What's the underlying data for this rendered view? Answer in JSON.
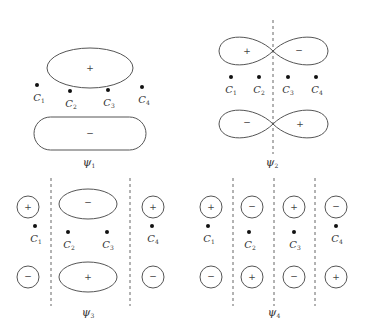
{
  "atoms": {
    "c1": {
      "base": "C",
      "sub": "1"
    },
    "c2": {
      "base": "C",
      "sub": "2"
    },
    "c3": {
      "base": "C",
      "sub": "3"
    },
    "c4": {
      "base": "C",
      "sub": "4"
    }
  },
  "signs": {
    "plus": "+",
    "minus": "−"
  },
  "orbitals": [
    {
      "label_base": "ψ",
      "label_sub": "1",
      "nodes": 0
    },
    {
      "label_base": "ψ",
      "label_sub": "2",
      "nodes": 1
    },
    {
      "label_base": "ψ",
      "label_sub": "3",
      "nodes": 2
    },
    {
      "label_base": "ψ",
      "label_sub": "4",
      "nodes": 3
    }
  ]
}
